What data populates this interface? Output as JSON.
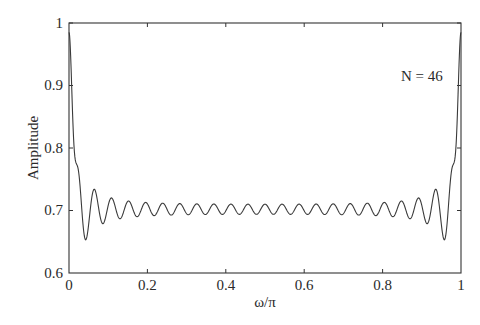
{
  "chart_data": {
    "type": "line",
    "title": "",
    "xlabel": "ω/π",
    "ylabel": "Amplitude",
    "xlim": [
      0,
      1
    ],
    "ylim": [
      0.6,
      1
    ],
    "grid": false,
    "legend": null,
    "x_ticks": [
      "0",
      "0.2",
      "0.4",
      "0.6",
      "0.8",
      "1"
    ],
    "y_ticks": [
      "0.6",
      "0.7",
      "0.8",
      "0.9",
      "1"
    ],
    "annotations": [
      {
        "text": "N = 46",
        "x": 0.86,
        "y": 0.93
      }
    ],
    "series": [
      {
        "name": "Amplitude response",
        "color": "#333333",
        "description": "Symmetric ripple response: starts near 0.985 at ω=0, dips to ~0.62, then decaying oscillation (~23 cycles) around ~0.702, rising back to ~0.985 at ω=π",
        "x": [
          0,
          0.03,
          0.05,
          0.075,
          0.094,
          0.116,
          0.138,
          0.16,
          0.181,
          0.203,
          0.225,
          0.5,
          0.775,
          0.797,
          0.819,
          0.84,
          0.862,
          0.884,
          0.906,
          0.925,
          0.95,
          0.97,
          1
        ],
        "values": [
          0.985,
          0.622,
          0.747,
          0.672,
          0.728,
          0.683,
          0.721,
          0.688,
          0.716,
          0.691,
          0.713,
          0.702,
          0.713,
          0.691,
          0.716,
          0.688,
          0.721,
          0.683,
          0.728,
          0.672,
          0.747,
          0.622,
          0.985
        ]
      }
    ]
  },
  "labels": {
    "xlabel": "ω/π",
    "ylabel": "Amplitude",
    "annotation": "N = 46",
    "x_ticks": [
      "0",
      "0.2",
      "0.4",
      "0.6",
      "0.8",
      "1"
    ],
    "y_ticks": [
      "0.6",
      "0.7",
      "0.8",
      "0.9",
      "1"
    ]
  }
}
